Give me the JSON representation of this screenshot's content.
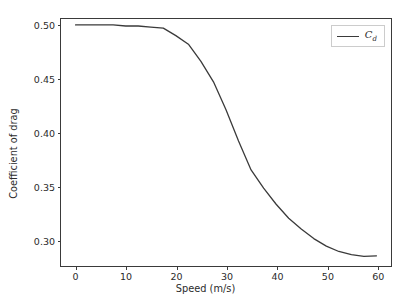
{
  "chart_data": {
    "type": "line",
    "title": "",
    "xlabel": "Speed (m/s)",
    "ylabel": "Coefficient of drag",
    "xlim": [
      -2.9,
      62.9
    ],
    "ylim": [
      0.2755,
      0.5055
    ],
    "xticks": [
      0,
      10,
      20,
      30,
      40,
      50,
      60
    ],
    "xtick_labels": [
      "0",
      "10",
      "20",
      "30",
      "40",
      "50",
      "60"
    ],
    "yticks": [
      0.3,
      0.35,
      0.4,
      0.45,
      0.5
    ],
    "ytick_labels": [
      "0.30",
      "0.35",
      "0.40",
      "0.45",
      "0.50"
    ],
    "grid": false,
    "legend_position": "upper right",
    "series": [
      {
        "name": "C_d",
        "legend_label": "C",
        "legend_sub": "d",
        "color": "#3a3a3a",
        "linewidth": 1.3,
        "x": [
          0,
          2.5,
          5,
          7.5,
          10,
          12.5,
          15,
          17.5,
          20,
          22.5,
          25,
          27.5,
          30,
          32.5,
          35,
          37.5,
          40,
          42.5,
          45,
          47.5,
          50,
          52.5,
          55,
          57.5,
          60
        ],
        "y": [
          0.5,
          0.5,
          0.5,
          0.5,
          0.499,
          0.499,
          0.498,
          0.497,
          0.49,
          0.482,
          0.466,
          0.447,
          0.421,
          0.392,
          0.365,
          0.348,
          0.333,
          0.32,
          0.31,
          0.301,
          0.294,
          0.289,
          0.286,
          0.2845,
          0.285
        ]
      }
    ],
    "colors": {
      "line": "#3a3a3a",
      "axes_frame": "#3a3a3a",
      "text": "#2b2b2b",
      "background": "#ffffff",
      "legend_border": "#cccccc"
    }
  }
}
